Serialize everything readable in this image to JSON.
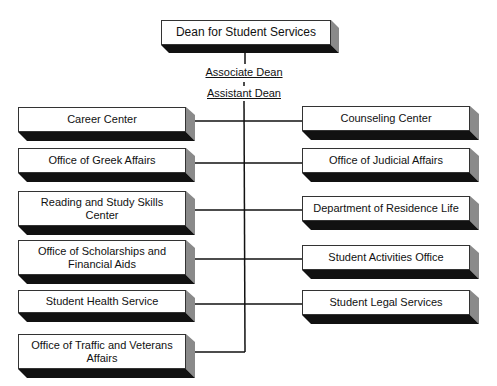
{
  "title_box": {
    "label": "Dean for Student Services"
  },
  "intermediate": {
    "associate": "Associate Dean",
    "assistant": "Assistant Dean"
  },
  "left_units": [
    {
      "label": "Career Center"
    },
    {
      "label": "Office of Greek Affairs"
    },
    {
      "label": "Reading and Study Skills Center"
    },
    {
      "label": "Office of Scholarships and Financial Aids"
    },
    {
      "label": "Student Health Service"
    },
    {
      "label": "Office of Traffic and Veterans Affairs"
    }
  ],
  "right_units": [
    {
      "label": "Counseling Center"
    },
    {
      "label": "Office of Judicial Affairs"
    },
    {
      "label": "Department of Residence Life"
    },
    {
      "label": "Student Activities Office"
    },
    {
      "label": "Student Legal Services"
    }
  ],
  "colors": {
    "line": "#111111",
    "shadow": "#111111",
    "side": "#8a8a8a",
    "box": "#ffffff"
  }
}
